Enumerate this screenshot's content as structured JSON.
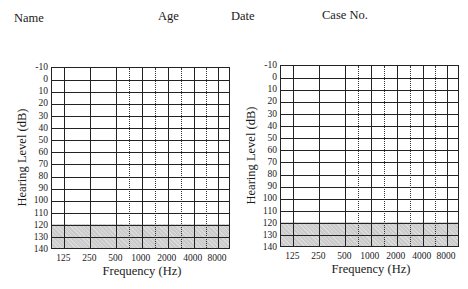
{
  "header": {
    "name_label": "Name",
    "age_label": "Age",
    "date_label": "Date",
    "case_label": "Case No."
  },
  "audiograms": [
    {
      "id": "left",
      "ylabel": "Hearing Level (dB)",
      "xlabel": "Frequency (Hz)"
    },
    {
      "id": "right",
      "ylabel": "Hearing Level (dB)",
      "xlabel": "Frequency (Hz)"
    }
  ],
  "axis": {
    "y_ticks": [
      "-10",
      "0",
      "10",
      "20",
      "30",
      "40",
      "50",
      "60",
      "70",
      "80",
      "90",
      "100",
      "110",
      "120",
      "130",
      "140"
    ],
    "x_ticks": [
      "125",
      "250",
      "500",
      "1000",
      "2000",
      "4000",
      "8000"
    ],
    "x_half_octaves": [
      "750",
      "1500",
      "3000",
      "6000"
    ],
    "shaded_range_db": [
      120,
      140
    ]
  },
  "colors": {
    "grid": "#222222",
    "shade": "#d0d0d0",
    "text": "#1a1a1a"
  }
}
